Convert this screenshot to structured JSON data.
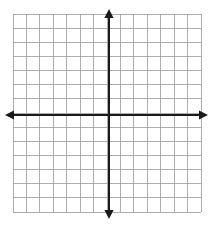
{
  "figure": {
    "title": "",
    "background_color": "#ffffff"
  },
  "chart_data": {
    "type": "scatter",
    "title": "",
    "subtitle": "",
    "xlabel": "",
    "ylabel": "",
    "x": [],
    "y": [],
    "series": [],
    "annotations": [],
    "xlim": [
      -7,
      7
    ],
    "ylim": [
      -7,
      7
    ],
    "xticks": [
      -7,
      -6,
      -5,
      -4,
      -3,
      -2,
      -1,
      0,
      1,
      2,
      3,
      4,
      5,
      6,
      7
    ],
    "yticks": [
      -7,
      -6,
      -5,
      -4,
      -3,
      -2,
      -1,
      0,
      1,
      2,
      3,
      4,
      5,
      6,
      7
    ],
    "xtick_labels": [],
    "ytick_labels": [],
    "grid": true,
    "grid_columns": 14,
    "grid_rows": 14,
    "legend": null,
    "legend_position": "none",
    "axis_style": "double-headed-arrow"
  },
  "geometry": {
    "grid_left": 13,
    "grid_top": 14,
    "grid_right": 201,
    "grid_bottom": 212,
    "cell_width": 13.43,
    "cell_height": 14.14,
    "origin_x": 109,
    "origin_y": 115,
    "x_axis_arrow_left_tip": 5,
    "x_axis_arrow_right_tip": 208,
    "y_axis_arrow_top_tip": 9,
    "y_axis_arrow_bottom_tip": 219
  },
  "style": {
    "grid_line_color": "#9a9a9a",
    "grid_line_width": 0.8,
    "axis_color": "#1a1a1a",
    "axis_line_width": 2.4,
    "arrow_color": "#1a1a1a"
  }
}
